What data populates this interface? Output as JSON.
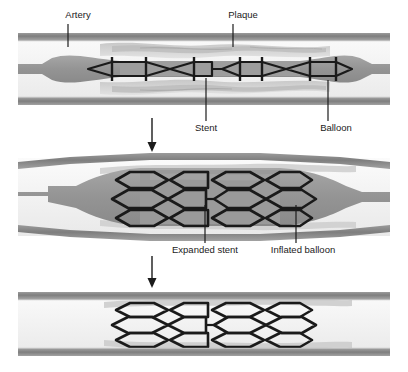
{
  "figure": {
    "type": "medical-illustration",
    "panel_count": 3,
    "colors": {
      "background": "#ffffff",
      "artery_wall": "#8d8d8d",
      "artery_wall_dark": "#6f6f6f",
      "lumen": "#f4f4f4",
      "plaque_light": "#d2d2d2",
      "plaque_mid": "#b8b8b8",
      "balloon": "#9a9a9a",
      "balloon_light": "#c9c9c9",
      "stent_stroke": "#1a1a1a",
      "label_text": "#1b1b1b",
      "leader_line": "#1b1b1b",
      "arrow": "#1b1b1b"
    }
  },
  "panels": [
    {
      "id": "panel-1",
      "caption": "Stent and balloon positioned across plaque",
      "stage_number": 1,
      "labels": [
        {
          "key": "artery",
          "text": "Artery",
          "text_x": 78,
          "text_y": 18,
          "anchor": "middle",
          "leader": {
            "x1": 68,
            "y1": 24,
            "x2": 68,
            "y2": 47
          }
        },
        {
          "key": "plaque",
          "text": "Plaque",
          "text_x": 243,
          "text_y": 18,
          "anchor": "middle",
          "leader": {
            "x1": 233,
            "y1": 24,
            "x2": 233,
            "y2": 47
          }
        },
        {
          "key": "stent",
          "text": "Stent",
          "text_x": 206,
          "text_y": 128,
          "anchor": "middle",
          "leader": {
            "x1": 206,
            "y1": 78,
            "x2": 206,
            "y2": 121
          }
        },
        {
          "key": "balloon",
          "text": "Balloon",
          "text_x": 336,
          "text_y": 128,
          "anchor": "middle",
          "leader": {
            "x1": 328,
            "y1": 80,
            "x2": 328,
            "y2": 121
          }
        }
      ]
    },
    {
      "id": "panel-2",
      "caption": "Balloon inflated, stent expanded against arterial wall",
      "stage_number": 2,
      "labels": [
        {
          "key": "expanded-stent",
          "text": "Expanded stent",
          "text_x": 205,
          "text_y": 250,
          "anchor": "middle",
          "leader": {
            "x1": 205,
            "y1": 205,
            "x2": 205,
            "y2": 243
          }
        },
        {
          "key": "inflated-balloon",
          "text": "Inflated balloon",
          "text_x": 303,
          "text_y": 250,
          "anchor": "middle",
          "leader": {
            "x1": 296,
            "y1": 205,
            "x2": 296,
            "y2": 243
          }
        }
      ]
    },
    {
      "id": "panel-3",
      "caption": "Balloon removed, stent remains holding artery open",
      "stage_number": 3,
      "labels": []
    }
  ],
  "arrows": [
    {
      "key": "arrow-1-to-2",
      "from_panel": "panel-1",
      "to_panel": "panel-2",
      "x": 152,
      "y1": 118,
      "y2": 152
    },
    {
      "key": "arrow-2-to-3",
      "from_panel": "panel-2",
      "to_panel": "panel-3",
      "x": 152,
      "y1": 256,
      "y2": 288
    }
  ],
  "label_texts": {
    "artery": "Artery",
    "plaque": "Plaque",
    "stent": "Stent",
    "balloon": "Balloon",
    "expanded_stent": "Expanded stent",
    "inflated_balloon": "Inflated balloon"
  }
}
